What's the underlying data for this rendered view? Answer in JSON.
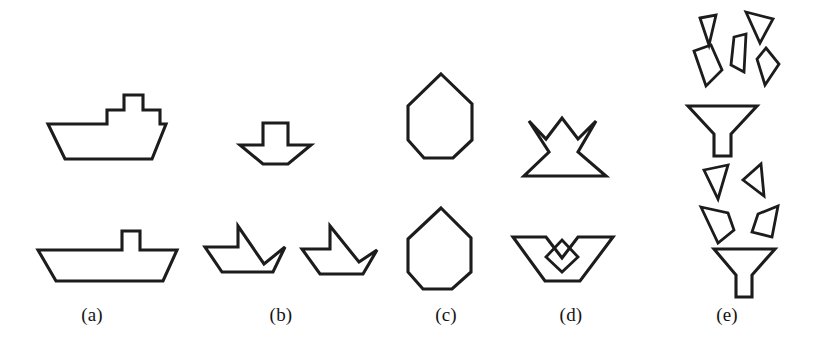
{
  "figure": {
    "background_color": "#ffffff",
    "stroke_color": "#1c1c1c",
    "width": 814,
    "height": 360,
    "columns": [
      {
        "key": "a",
        "label": "(a)",
        "label_x": 92,
        "upper_shape_name": "stepped-boat-outline",
        "lower_shape_name": "boat-with-mast-outline"
      },
      {
        "key": "b",
        "label": "(b)",
        "label_x": 281,
        "upper_shape_name": "small-arrow-boat-outline",
        "lower_shape_name": "two-sailboat-outlines"
      },
      {
        "key": "c",
        "label": "(c)",
        "label_x": 446,
        "upper_shape_name": "heptagon-outline",
        "lower_shape_name": "heptagon-outline"
      },
      {
        "key": "d",
        "label": "(d)",
        "label_x": 571,
        "upper_shape_name": "crown-outline",
        "lower_shape_name": "bowl-with-diamond-outline"
      },
      {
        "key": "e",
        "label": "(e)",
        "label_x": 727,
        "upper_shape_name": "funnel-with-five-fragments",
        "lower_shape_name": "funnel-with-four-fragments"
      }
    ],
    "shapes": [
      {
        "name": "a-upper-stepped-boat",
        "column": "a",
        "position": "upper",
        "points": "48,124 107,124 107,110 124,110 124,95 143,95 143,110 160,110 160,124 166,124 166,124 166,124 166,124",
        "path": "M48,124 L107,124 L107,110 L124,110 L124,95 L143,95 L143,110 L160,110 L160,124 L166,124 L152,159 L65,159 Z"
      },
      {
        "name": "a-lower-boat-with-mast",
        "column": "a",
        "position": "upper",
        "path": "M38,250 L122,250 L122,231 L140,231 L140,250 L177,250 L163,281 L56,281 Z"
      },
      {
        "name": "b-upper-small-arrow-boat",
        "column": "b",
        "position": "upper",
        "path": "M240,145 L263,145 L263,123 L288,123 L288,145 L311,145 L288,164 L263,164 Z"
      },
      {
        "name": "b-lower-sailboat-left",
        "column": "b",
        "position": "lower",
        "path": "M205,247 L238,247 L238,226 L264,264 L285,247 L273,272 L222,272 Z"
      },
      {
        "name": "b-lower-sailboat-right",
        "column": "b",
        "position": "lower",
        "path": "M302,249 L330,249 L330,226 L359,262 L377,250 L363,274 L320,274 Z"
      },
      {
        "name": "c-upper-heptagon",
        "column": "c",
        "position": "upper",
        "path": "M441,74 L472,104 L472,140 L453,158 L424,158 L408,140 L408,106 Z"
      },
      {
        "name": "c-lower-heptagon",
        "column": "c",
        "position": "lower",
        "path": "M441,208 L471,238 L471,272 L452,289 L423,289 L408,272 L408,239 Z"
      },
      {
        "name": "d-upper-crown",
        "column": "d",
        "position": "upper",
        "path": "M529,121 L546,139 L562,118 L578,139 L596,121 L578,152 L606,176 L524,176 L549,152 Z"
      },
      {
        "name": "d-lower-bowl-with-diamond",
        "column": "d",
        "position": "lower",
        "path": "M513,237 L546,237 L562,258 L578,237 L613,237 L580,281 L545,281 Z"
      },
      {
        "name": "d-lower-diamond-inset",
        "column": "d",
        "position": "lower",
        "path": "M562,240 L578,257 L562,272 L546,257 Z"
      },
      {
        "name": "e-upper-funnel",
        "column": "e",
        "position": "upper",
        "path": "M688,106 L757,106 L731,134 L731,156 L714,156 L714,134 Z"
      },
      {
        "name": "e-upper-fragment-1",
        "column": "e",
        "position": "upper",
        "path": "M700,18 L716,15 L709,45 Z"
      },
      {
        "name": "e-upper-fragment-2",
        "column": "e",
        "position": "upper",
        "path": "M746,12 L773,19 L760,43 Z"
      },
      {
        "name": "e-upper-fragment-3",
        "column": "e",
        "position": "upper",
        "path": "M694,51 L711,45 L722,70 L706,86 Z"
      },
      {
        "name": "e-upper-fragment-4",
        "column": "e",
        "position": "upper",
        "path": "M734,37 L746,34 L744,72 L731,65 Z"
      },
      {
        "name": "e-upper-fragment-5",
        "column": "e",
        "position": "upper",
        "path": "M766,48 L779,64 L765,85 L757,59 Z"
      },
      {
        "name": "e-lower-funnel",
        "column": "e",
        "position": "lower",
        "path": "M714,249 L775,249 L752,275 L752,297 L736,297 L736,275 Z"
      },
      {
        "name": "e-lower-fragment-1",
        "column": "e",
        "position": "lower",
        "path": "M704,170 L728,165 L718,199 Z"
      },
      {
        "name": "e-lower-fragment-2",
        "column": "e",
        "position": "lower",
        "path": "M761,164 L764,196 L743,180 Z"
      },
      {
        "name": "e-lower-fragment-3",
        "column": "e",
        "position": "lower",
        "path": "M701,207 L728,213 L734,230 L718,243 Z"
      },
      {
        "name": "e-lower-fragment-4",
        "column": "e",
        "position": "lower",
        "path": "M778,206 L772,237 L752,232 L758,214 Z"
      }
    ]
  }
}
